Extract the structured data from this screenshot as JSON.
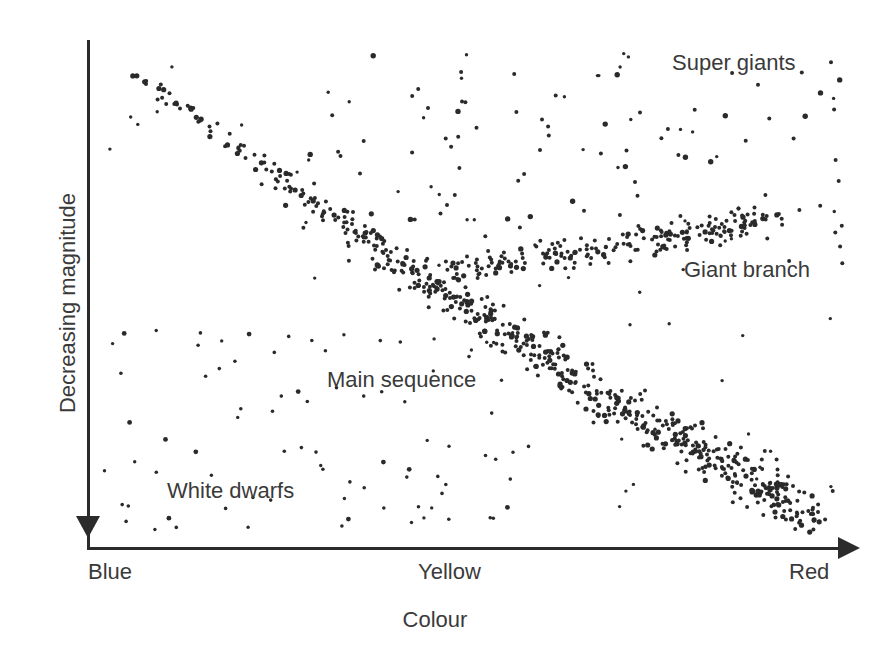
{
  "chart_data": {
    "type": "scatter",
    "title": "",
    "xlabel": "Colour",
    "ylabel": "Decreasing magnitude",
    "xtick_labels": [
      "Blue",
      "Yellow",
      "Red"
    ],
    "ytick_labels": [],
    "grid": false,
    "legend_position": "none",
    "axis_style": {
      "x_axis_arrow": "right",
      "y_axis_arrow": "down-at-origin",
      "axis_color": "#2b2b2b"
    },
    "annotations": [
      {
        "text": "Super giants",
        "x": 0.78,
        "y": 0.95,
        "region": "top-right"
      },
      {
        "text": "Giant branch",
        "x": 0.79,
        "y": 0.57,
        "region": "mid-right"
      },
      {
        "text": "Main sequence",
        "x": 0.33,
        "y": 0.36,
        "region": "center-left"
      },
      {
        "text": "White dwarfs",
        "x": 0.11,
        "y": 0.14,
        "region": "bottom-left"
      }
    ],
    "groups": [
      {
        "name": "Main sequence",
        "description": "Dense diagonal band running from upper-left (blue, bright) to lower-right (red, faint)",
        "n_points": 620,
        "color": "#2a2a2a"
      },
      {
        "name": "Giant branch",
        "description": "Horizontal band in the upper-right rising slightly toward red",
        "n_points": 210,
        "color": "#2a2a2a"
      },
      {
        "name": "Super giants",
        "description": "Sparse scatter across the top of the plot",
        "n_points": 95,
        "color": "#2a2a2a"
      },
      {
        "name": "White dwarfs",
        "description": "Sparse scatter in the lower-left below the main sequence",
        "n_points": 60,
        "color": "#2a2a2a"
      }
    ]
  },
  "axes": {
    "y_label": "Decreasing magnitude",
    "x_label": "Colour",
    "x_ticks": {
      "blue": "Blue",
      "yellow": "Yellow",
      "red": "Red"
    }
  },
  "annotations": {
    "super_giants": "Super giants",
    "giant_branch": "Giant branch",
    "main_sequence": "Main sequence",
    "white_dwarfs": "White dwarfs"
  },
  "colors": {
    "axis": "#2b2b2b",
    "text": "#3a3a3a",
    "point": "#2a2a2a",
    "background": "#ffffff"
  }
}
